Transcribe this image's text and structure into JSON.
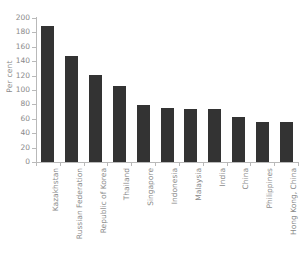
{
  "chart_data": {
    "type": "bar",
    "title": "",
    "subtitle": "",
    "xlabel": "",
    "ylabel": "Per cent",
    "ylim": [
      0,
      200
    ],
    "ytick_step": 20,
    "yticks": [
      0,
      20,
      40,
      60,
      80,
      100,
      120,
      140,
      160,
      180,
      200
    ],
    "grid": false,
    "legend": null,
    "bar_color": "#333333",
    "axis_color": "#b9b9b9",
    "text_color": "#8a8a8a",
    "categories": [
      "Kazakhstan",
      "Russian Federation",
      "Republic of Korea",
      "Thailand",
      "Singapore",
      "Indonesia",
      "Malaysia",
      "India",
      "China",
      "Philippines",
      "Hong Kong, China"
    ],
    "values": [
      189,
      147,
      121,
      106,
      79,
      75,
      74,
      74,
      63,
      56,
      56
    ]
  }
}
